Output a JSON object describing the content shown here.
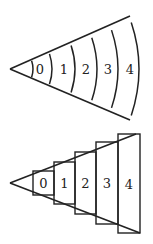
{
  "top_diagram": {
    "description": "Wedge with curved arc bands",
    "apex": [
      10,
      69
    ],
    "upper_end": [
      130,
      16
    ],
    "lower_end": [
      130,
      120
    ],
    "arcs_x": [
      33,
      52,
      75,
      97,
      118,
      139
    ],
    "labels": [
      "0",
      "1",
      "2",
      "3",
      "4"
    ],
    "label_x": [
      40,
      64,
      86,
      108,
      130
    ],
    "label_y": 74
  },
  "bottom_diagram": {
    "description": "Wedge approximated by rectangular boxes",
    "apex": [
      10,
      183
    ],
    "upper_end": [
      136,
      134
    ],
    "lower_end": [
      140,
      233
    ],
    "boxes": [
      {
        "label": "0",
        "x": 33,
        "y": 171,
        "w": 21,
        "h": 24
      },
      {
        "label": "1",
        "x": 54,
        "y": 162,
        "w": 21,
        "h": 42
      },
      {
        "label": "2",
        "x": 75,
        "y": 152,
        "w": 21,
        "h": 62
      },
      {
        "label": "3",
        "x": 96,
        "y": 142,
        "w": 22,
        "h": 82
      },
      {
        "label": "4",
        "x": 118,
        "y": 134,
        "w": 22,
        "h": 99
      }
    ]
  },
  "colors": {
    "stroke": "#222222",
    "background": "#ffffff"
  }
}
